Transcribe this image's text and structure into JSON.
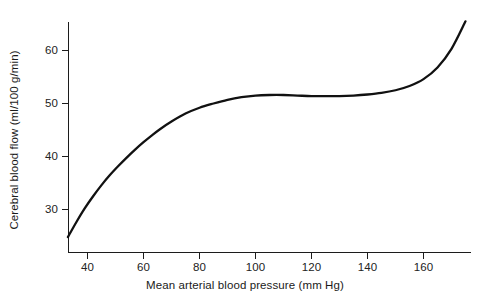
{
  "chart_data": {
    "type": "line",
    "title": "",
    "xlabel": "Mean arterial blood pressure (mm Hg)",
    "ylabel": "Cerebral blood flow (ml/100 g/min)",
    "xlim": [
      33,
      177
    ],
    "ylim": [
      24,
      67
    ],
    "grid": false,
    "legend": null,
    "xticks": [
      40,
      60,
      80,
      100,
      120,
      140,
      160
    ],
    "yticks": [
      30,
      40,
      50,
      60
    ],
    "xtick_labels": [
      "40",
      "60",
      "80",
      "100",
      "120",
      "140",
      "160"
    ],
    "ytick_labels": [
      "30",
      "40",
      "50",
      "60"
    ],
    "series": [
      {
        "name": "Cerebral autoregulation curve",
        "x": [
          33,
          36,
          39,
          42,
          45,
          48,
          51,
          54,
          57,
          60,
          63,
          66,
          70,
          75,
          80,
          85,
          90,
          95,
          100,
          105,
          110,
          115,
          120,
          125,
          130,
          135,
          140,
          145,
          150,
          155,
          160,
          165,
          170,
          175
        ],
        "y": [
          24.8,
          27.6,
          30.2,
          32.5,
          34.6,
          36.5,
          38.2,
          39.8,
          41.3,
          42.7,
          44.0,
          45.2,
          46.6,
          48.1,
          49.2,
          50.0,
          50.7,
          51.2,
          51.5,
          51.6,
          51.6,
          51.5,
          51.4,
          51.4,
          51.4,
          51.5,
          51.7,
          52.0,
          52.5,
          53.3,
          54.6,
          56.8,
          60.3,
          65.5
        ]
      }
    ],
    "annotations": []
  },
  "axes": {
    "x_axis_name": "mean-arterial-blood-pressure-axis",
    "y_axis_name": "cerebral-blood-flow-axis"
  }
}
